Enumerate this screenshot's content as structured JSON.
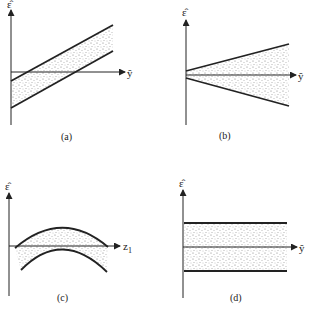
{
  "figure": {
    "panels": [
      {
        "id": "a",
        "caption": "(a)",
        "y_label": "ε̂",
        "x_label": "ŷ",
        "shape": "parallel-increasing-band"
      },
      {
        "id": "b",
        "caption": "(b)",
        "y_label": "ε̂",
        "x_label": "ŷ",
        "shape": "funnel-widening-band"
      },
      {
        "id": "c",
        "caption": "(c)",
        "y_label": "ε̂",
        "x_label": "z",
        "x_label_sub": "1",
        "shape": "curved-arc-band"
      },
      {
        "id": "d",
        "caption": "(d)",
        "y_label": "ε̂",
        "x_label": "ŷ",
        "shape": "horizontal-band"
      }
    ]
  },
  "colors": {
    "ink": "#222222",
    "stipple": "#555555",
    "background": "#ffffff"
  }
}
